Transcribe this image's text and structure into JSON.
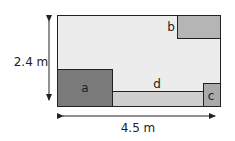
{
  "diagram": {
    "height_label": "2.4 m",
    "width_label": "4.5 m",
    "regions": {
      "a": {
        "label": "a",
        "color": "#7a7a7a"
      },
      "b": {
        "label": "b",
        "color": "#b5b5b5"
      },
      "c": {
        "label": "c",
        "color": "#aaaaaa"
      },
      "d": {
        "label": "d",
        "color": "#cfcfcf"
      }
    },
    "background_color": "#ececec",
    "border_color": "#222222"
  }
}
